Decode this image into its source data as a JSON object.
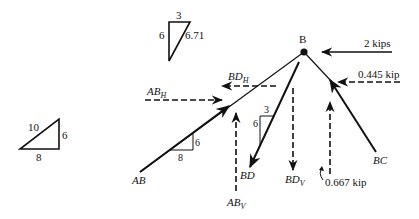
{
  "diagram": {
    "node": {
      "label": "B"
    },
    "slope_triangles": {
      "top": {
        "horizontal": "3",
        "vertical": "6",
        "hypotenuse": "6.71"
      },
      "left": {
        "hypotenuse": "10",
        "vertical": "6",
        "horizontal": "8"
      },
      "on_AB": {
        "vertical": "6",
        "horizontal": "8"
      },
      "on_BD": {
        "horizontal": "3",
        "vertical": "6"
      }
    },
    "members": {
      "AB": {
        "label": "AB",
        "h_label_main": "AB",
        "h_label_sub": "H",
        "v_label_main": "AB",
        "v_label_sub": "V"
      },
      "BD": {
        "label": "BD",
        "h_label_main": "BD",
        "h_label_sub": "H",
        "v_label_main": "BD",
        "v_label_sub": "V"
      },
      "BC": {
        "label": "BC"
      }
    },
    "loads": {
      "horizontal_load": "2 kips",
      "bc_horizontal": "0.445 kip",
      "bc_vertical": "0.667 kip"
    },
    "colors": {
      "line": "#111111",
      "background": "#ffffff"
    }
  }
}
